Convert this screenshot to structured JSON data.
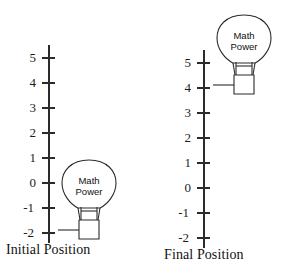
{
  "figure": {
    "background_color": "#ffffff",
    "stroke_color": "#2b2b2b",
    "text_color": "#111111",
    "width": 284,
    "height": 267
  },
  "panels": [
    {
      "id": "initial",
      "caption": "Initial Position",
      "axis": {
        "tick_labels": [
          "5",
          "4",
          "3",
          "2",
          "1",
          "0",
          "-1",
          "-2"
        ],
        "tick_values": [
          5,
          4,
          3,
          2,
          1,
          0,
          -1,
          -2
        ],
        "top_y": 45,
        "bottom_y": 243,
        "spacing_px": 25,
        "axis_x": 49
      },
      "object": {
        "name": "light-bulb",
        "label_line_1": "Math",
        "label_line_2": "Power",
        "marked_value": 4
      }
    },
    {
      "id": "final",
      "caption": "Final Position",
      "axis": {
        "tick_labels": [
          "5",
          "4",
          "3",
          "2",
          "1",
          "0",
          "-1",
          "-2"
        ],
        "tick_values": [
          5,
          4,
          3,
          2,
          1,
          0,
          -1,
          -2
        ],
        "top_y": 50,
        "bottom_y": 248,
        "spacing_px": 25,
        "axis_x": 62
      },
      "object": {
        "name": "light-bulb",
        "label_line_1": "Math",
        "label_line_2": "Power",
        "marked_value": 4
      }
    }
  ]
}
